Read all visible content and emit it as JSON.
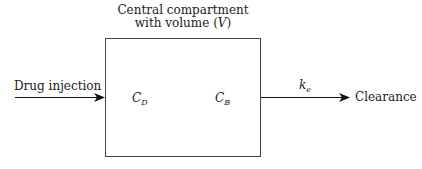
{
  "diagram": {
    "compartment": {
      "title_line1": "Central compartment",
      "title_line2_prefix": "with volume (",
      "title_line2_var": "V",
      "title_line2_suffix": ")"
    },
    "input_label": "Drug injection",
    "output_label": "Clearance",
    "rate_constant": {
      "base": "k",
      "sub": "e"
    },
    "concentrations": [
      {
        "base": "C",
        "sub": "D"
      },
      {
        "base": "C",
        "sub": "B"
      }
    ]
  }
}
